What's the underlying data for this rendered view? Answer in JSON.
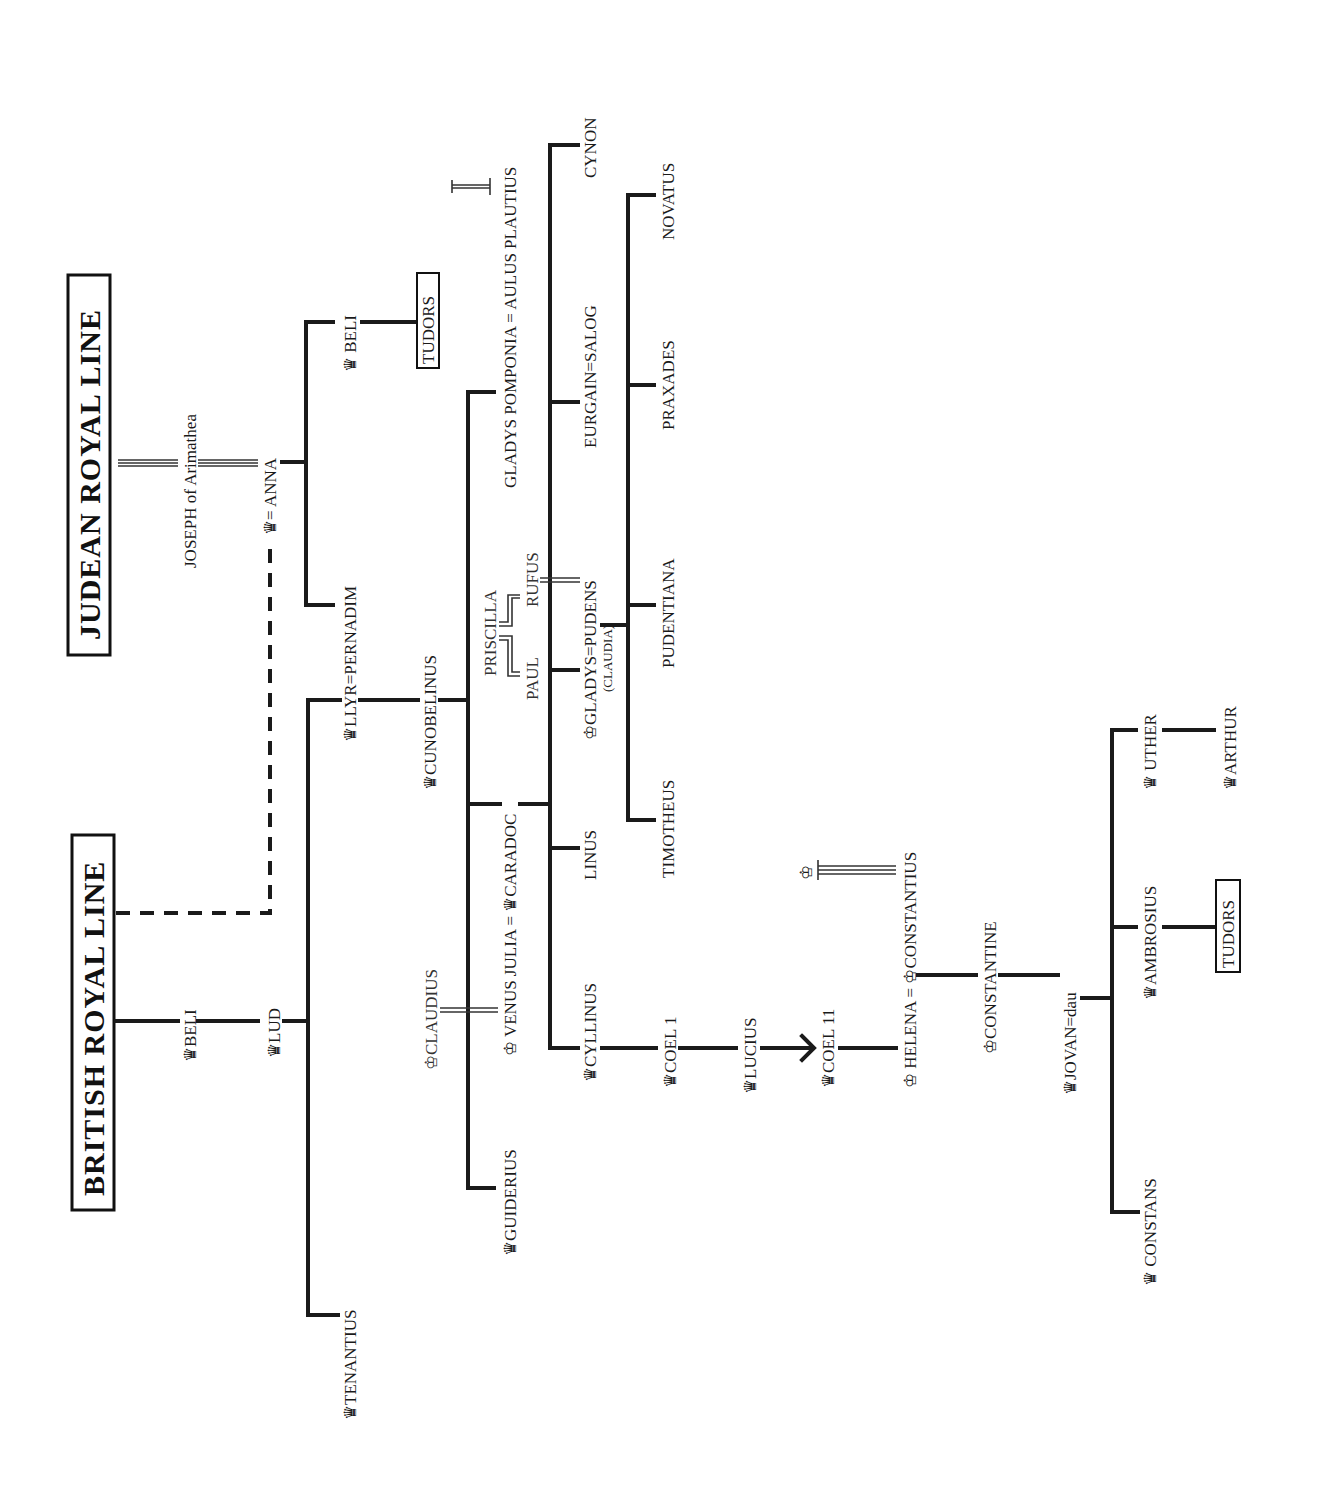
{
  "titles": {
    "judean": "JUDEAN ROYAL LINE",
    "british": "BRITISH ROYAL LINE"
  },
  "crown": "♛",
  "crown_outline": "♔",
  "people": {
    "joseph": "JOSEPH of Arimathea",
    "anna": "♛= ANNA",
    "beli_judean": "♛ BELI",
    "tudors_1": "TUDORS",
    "beli": "♛BELI",
    "lud": "♛LUD",
    "llyr": "♛LLYR=PERNADIM",
    "pernadim": "PERNADIM",
    "tenantius": "♛TENANTIUS",
    "cunobelinus": "♛CUNOBELINUS",
    "claudius": "♔CLAUDIUS",
    "venus_julia_caradoc": "♔ VENUS JULIA = ♛CARADOC",
    "guiderius": "♛GUIDERIUS",
    "gladys_pomponia": "GLADYS POMPONIA = AULUS PLAUTIUS",
    "priscilla": "PRISCILLA",
    "paul": "PAUL",
    "rufus": "RUFUS",
    "gladys_pudens": "♔GLADYS=PUDENS",
    "claudia": "(CLAUDIA)",
    "cynon": "CYNON",
    "eurgain": "EURGAIN=SALOG",
    "linus": "LINUS",
    "cyllinus": "♛CYLLINUS",
    "novatus": "NOVATUS",
    "praxades": "PRAXADES",
    "pudentiana": "PUDENTIANA",
    "timotheus": "TIMOTHEUS",
    "coel1": "♛COEL 1",
    "lucius": "♛LUCIUS",
    "coel11": "♛COEL 11",
    "helena_constantius": "♔ HELENA = ♔CONSTANTIUS",
    "constantine": "♔CONSTANTINE",
    "jovan": "♛JOVAN=dau",
    "uther": "♛ UTHER",
    "arthur": "♛ARTHUR",
    "ambrosius": "♛AMBROSIUS",
    "tudors_2": "TUDORS",
    "constans": "♛ CONSTANS"
  }
}
